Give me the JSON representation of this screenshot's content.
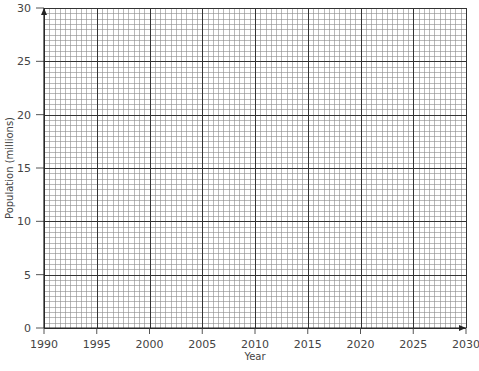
{
  "chart_data": {
    "type": "line",
    "title": "",
    "xlabel": "Year",
    "ylabel": "Population (millions)",
    "xlim": [
      1990,
      2030
    ],
    "ylim": [
      0,
      30
    ],
    "x_ticks": [
      "1990",
      "1995",
      "2000",
      "2005",
      "2010",
      "2015",
      "2020",
      "2025",
      "2030"
    ],
    "y_ticks": [
      "0",
      "5",
      "10",
      "15",
      "20",
      "25",
      "30"
    ],
    "grid": true,
    "grid_minor_step_x": 0.5,
    "grid_minor_step_y": 0.5,
    "grid_major_step_x": 5,
    "grid_major_step_y": 5,
    "series": [],
    "note": "Blank graph paper grid with no plotted data"
  },
  "colors": {
    "grid_minor": "#8a8a8a",
    "grid_major": "#333333",
    "text": "#444444"
  }
}
